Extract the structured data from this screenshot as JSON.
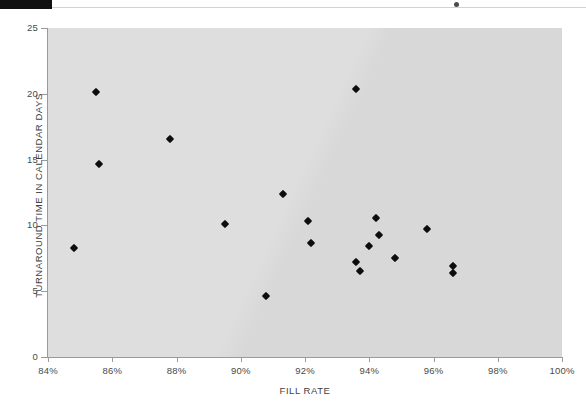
{
  "chart_data": {
    "type": "scatter",
    "title": "",
    "xlabel": "FILL RATE",
    "ylabel": "TURNAROUND TIME IN CALENDAR DAYS",
    "xlim": [
      84,
      100
    ],
    "ylim": [
      0,
      25
    ],
    "x_ticks": [
      "84%",
      "86%",
      "88%",
      "90%",
      "92%",
      "94%",
      "96%",
      "98%",
      "100%"
    ],
    "x_tick_values": [
      84,
      86,
      88,
      90,
      92,
      94,
      96,
      98,
      100
    ],
    "y_ticks": [
      "0",
      "5",
      "10",
      "15",
      "20",
      "25"
    ],
    "y_tick_values": [
      0,
      5,
      10,
      15,
      20,
      25
    ],
    "grid": false,
    "legend": null,
    "plot_background": "#dcdcdc",
    "marker_color": "#0d0d0d",
    "marker_shape": "diamond",
    "points": [
      {
        "x": 84.8,
        "y": 8.3
      },
      {
        "x": 85.5,
        "y": 20.1
      },
      {
        "x": 85.6,
        "y": 14.7
      },
      {
        "x": 87.8,
        "y": 16.6
      },
      {
        "x": 89.5,
        "y": 10.1
      },
      {
        "x": 90.8,
        "y": 4.6
      },
      {
        "x": 91.3,
        "y": 12.4
      },
      {
        "x": 92.1,
        "y": 10.3
      },
      {
        "x": 92.2,
        "y": 8.7
      },
      {
        "x": 93.6,
        "y": 20.4
      },
      {
        "x": 93.6,
        "y": 7.2
      },
      {
        "x": 93.7,
        "y": 6.5
      },
      {
        "x": 94.0,
        "y": 8.4
      },
      {
        "x": 94.2,
        "y": 10.6
      },
      {
        "x": 94.3,
        "y": 9.3
      },
      {
        "x": 94.8,
        "y": 7.5
      },
      {
        "x": 95.8,
        "y": 9.7
      },
      {
        "x": 96.6,
        "y": 6.9
      },
      {
        "x": 96.6,
        "y": 6.4
      }
    ]
  },
  "page": {
    "artifact_black_bar": "",
    "artifact_rule": "",
    "artifact_speck": ""
  }
}
